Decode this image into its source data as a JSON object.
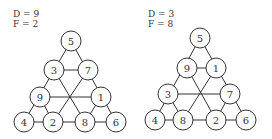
{
  "panels": [
    {
      "d_label": "D = 9",
      "f_label": "F = 2",
      "nodes": {
        "top": "5",
        "row2_left": "3",
        "row2_right": "7",
        "row3_left": "9",
        "row3_right": "1",
        "bottom_1": "4",
        "bottom_2": "2",
        "bottom_3": "8",
        "bottom_4": "6"
      }
    },
    {
      "d_label": "D = 3",
      "f_label": "F = 8",
      "nodes": {
        "top": "5",
        "row2_left": "9",
        "row2_right": "1",
        "row3_left": "3",
        "row3_right": "7",
        "bottom_1": "4",
        "bottom_2": "8",
        "bottom_3": "2",
        "bottom_4": "6"
      }
    }
  ]
}
